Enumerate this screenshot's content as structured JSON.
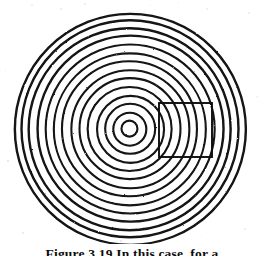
{
  "document": {
    "page_background": "#ffffff",
    "ink_color": "#111111"
  },
  "figure": {
    "title_visible": false,
    "caption_text": "Figure 3.19  In this case, for a",
    "caption_truncated": true,
    "caption_note": "caption is clipped by the bottom edge of the image; only the upper portion of the glyphs is visible"
  },
  "chart_data": {
    "type": "scatter",
    "xlabel": "",
    "ylabel": "",
    "xlim": [
      0,
      264
    ],
    "ylim": [
      0,
      256
    ],
    "grid": false,
    "legend": "none",
    "center": {
      "x": 130,
      "y": 129
    },
    "ring_count": 14,
    "ring_radii": [
      8,
      16.5,
      25,
      33.5,
      42,
      50.5,
      59,
      67.5,
      76,
      84.5,
      93,
      101,
      108.5,
      115.5
    ],
    "ring_stroke_width": 2.1,
    "ring_color": "#121212",
    "rectangle": {
      "label": "region-of-interest box",
      "x": 159,
      "y": 103,
      "width": 53,
      "height": 54,
      "stroke_color": "#101010",
      "stroke_width": 1.9,
      "fill": "none"
    }
  }
}
